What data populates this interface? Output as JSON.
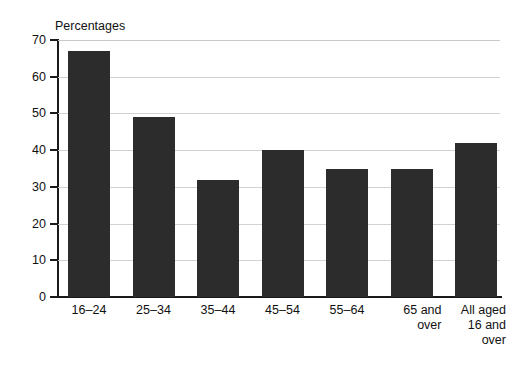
{
  "chart_data": {
    "type": "bar",
    "title": "Percentages",
    "xlabel": "",
    "ylabel": "",
    "ylim": [
      0,
      70
    ],
    "ytick_step": 10,
    "yticks": [
      70,
      60,
      50,
      40,
      30,
      20,
      10,
      0
    ],
    "grid": true,
    "legend": "none",
    "bar_color": "#2c2c2c",
    "gridline_color": "#d2d2d2",
    "axis_color": "#1a1a1a",
    "categories": [
      "16–24",
      "25–34",
      "35–44",
      "45–54",
      "55–64",
      "65 and over",
      "All aged 16 and over"
    ],
    "category_lines": [
      [
        "16–24"
      ],
      [
        "25–34"
      ],
      [
        "35–44"
      ],
      [
        "45–54"
      ],
      [
        "55–64"
      ],
      [
        "65 and",
        "over"
      ],
      [
        "All aged",
        "16 and",
        "over"
      ]
    ],
    "values": [
      67,
      49,
      32,
      40,
      35,
      35,
      42
    ]
  }
}
